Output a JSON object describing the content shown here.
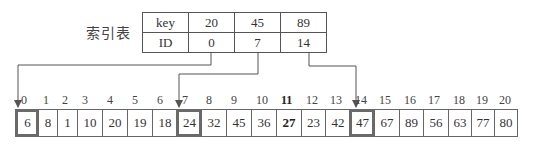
{
  "index_table": {
    "title": "索引表",
    "rows": [
      {
        "header": "key",
        "values": [
          "20",
          "45",
          "89"
        ]
      },
      {
        "header": "ID",
        "values": [
          "0",
          "7",
          "14"
        ]
      }
    ]
  },
  "array": {
    "indices": [
      "0",
      "1",
      "2",
      "3",
      "4",
      "5",
      "6",
      "7",
      "8",
      "9",
      "10",
      "11",
      "12",
      "13",
      "14",
      "15",
      "16",
      "17",
      "18",
      "19",
      "20"
    ],
    "values": [
      "6",
      "8",
      "1",
      "10",
      "20",
      "19",
      "18",
      "24",
      "32",
      "45",
      "36",
      "27",
      "23",
      "42",
      "47",
      "67",
      "89",
      "56",
      "63",
      "77",
      "80"
    ],
    "highlighted_indices": [
      0,
      7,
      14
    ],
    "bold_index": 11
  },
  "colors": {
    "line": "#555555",
    "highlight_border": "#6a6a6a"
  }
}
